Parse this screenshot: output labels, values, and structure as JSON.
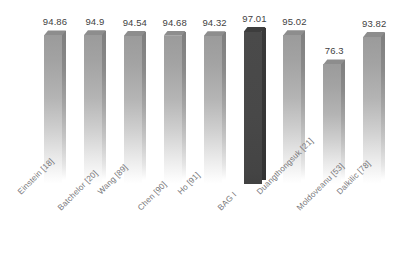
{
  "chart_data": {
    "type": "bar",
    "title": "",
    "subtitle": "",
    "xlabel": "",
    "ylabel": "",
    "ylim": [
      0,
      100
    ],
    "grid": false,
    "legend": "none",
    "orientation": "vertical",
    "value_labels_shown": true,
    "categories": [
      "Einstein [18]",
      "Batchelor [20]",
      "Wang [89]",
      "Chen [90]",
      "Ho [91]",
      "BAG I",
      "Duangthongsuk [21]",
      "Moldoveanu [53]",
      "Dalkilic [78]"
    ],
    "values": [
      94.86,
      94.9,
      94.54,
      94.68,
      94.32,
      97.01,
      95.02,
      76.3,
      93.82
    ],
    "value_label_text": [
      "94.86",
      "94.9",
      "94.54",
      "94.68",
      "94.32",
      "97.01",
      "95.02",
      "76.3",
      "93.82"
    ],
    "highlighted_index": 5,
    "colors": {
      "bar_fill_top": "#9b9b9b",
      "bar_fill_bottom": "#ffffff",
      "bar_side": "#8a8a8a",
      "bar_top_face": "#8d8d8d",
      "highlight_fill": "#484848",
      "highlight_side": "#363636",
      "highlight_top_face": "#3d3d3d",
      "value_label_color": "#3f3f3f",
      "category_label_color": "#77777a",
      "background": "#ffffff"
    }
  }
}
